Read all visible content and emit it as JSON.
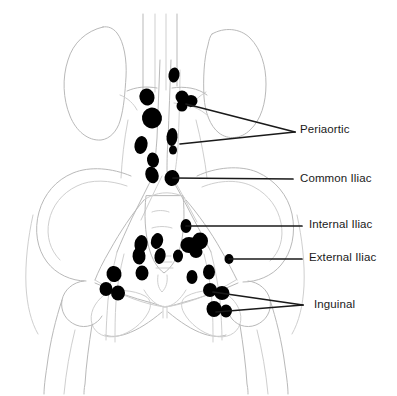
{
  "figure": {
    "name": "pelvic-lymph-node-regions-diagram",
    "background_color": "#ffffff",
    "node_color": "#000000",
    "outline_color": "#b9b9b9",
    "leader_color": "#1a1a1a",
    "text_color": "#1a1a1a"
  },
  "labels": [
    {
      "id": "periaortic",
      "text": "Periaortic",
      "x": 300,
      "y": 124,
      "leaders": [
        {
          "points": "295,132 186,104"
        },
        {
          "points": "295,132 180,144"
        }
      ]
    },
    {
      "id": "common-iliac",
      "text": "Common Iliac",
      "x": 300,
      "y": 173,
      "leaders": [
        {
          "points": "293,179 173,178"
        }
      ]
    },
    {
      "id": "internal-iliac",
      "text": "Internal Iliac",
      "x": 309,
      "y": 219,
      "leaders": [
        {
          "points": "302,226 186,226"
        }
      ]
    },
    {
      "id": "external-iliac",
      "text": "External Iliac",
      "x": 309,
      "y": 252,
      "leaders": [
        {
          "points": "302,259 229,259"
        }
      ]
    },
    {
      "id": "inguinal",
      "text": "Inguinal",
      "x": 314,
      "y": 299,
      "leaders": [
        {
          "points": "303,305 213,292"
        },
        {
          "points": "303,305 216,312"
        }
      ]
    }
  ],
  "lymph_nodes": [
    {
      "region": "periaortic",
      "cx": 174,
      "cy": 75,
      "rx": 5.5,
      "ry": 7.5,
      "rot": 10
    },
    {
      "region": "periaortic",
      "cx": 147,
      "cy": 97,
      "rx": 7.5,
      "ry": 8.5,
      "rot": -15
    },
    {
      "region": "periaortic",
      "cx": 182,
      "cy": 97,
      "rx": 6.5,
      "ry": 6.5,
      "rot": 0
    },
    {
      "region": "periaortic",
      "cx": 191,
      "cy": 101,
      "rx": 6.5,
      "ry": 6.0,
      "rot": 0
    },
    {
      "region": "periaortic",
      "cx": 182,
      "cy": 106,
      "rx": 5.5,
      "ry": 5.5,
      "rot": 0
    },
    {
      "region": "periaortic",
      "cx": 152,
      "cy": 118,
      "rx": 10.0,
      "ry": 10.5,
      "rot": -10
    },
    {
      "region": "periaortic",
      "cx": 141,
      "cy": 145,
      "rx": 6.5,
      "ry": 9.0,
      "rot": 12
    },
    {
      "region": "periaortic",
      "cx": 172,
      "cy": 137,
      "rx": 5.5,
      "ry": 9.0,
      "rot": 5
    },
    {
      "region": "periaortic",
      "cx": 173,
      "cy": 150,
      "rx": 4.0,
      "ry": 4.5,
      "rot": 0
    },
    {
      "region": "periaortic",
      "cx": 153,
      "cy": 160,
      "rx": 6.0,
      "ry": 7.5,
      "rot": -8
    },
    {
      "region": "common-iliac",
      "cx": 152,
      "cy": 175,
      "rx": 6.5,
      "ry": 8.5,
      "rot": -20
    },
    {
      "region": "common-iliac",
      "cx": 172,
      "cy": 178,
      "rx": 7.5,
      "ry": 8.0,
      "rot": 8
    },
    {
      "region": "internal-iliac",
      "cx": 186,
      "cy": 226,
      "rx": 5.5,
      "ry": 7.0,
      "rot": 0
    },
    {
      "region": "internal-iliac",
      "cx": 189,
      "cy": 245,
      "rx": 8.5,
      "ry": 8.0,
      "rot": 0
    },
    {
      "region": "internal-iliac",
      "cx": 200,
      "cy": 241,
      "rx": 8.0,
      "ry": 8.5,
      "rot": 0
    },
    {
      "region": "internal-iliac",
      "cx": 196,
      "cy": 252,
      "rx": 6.5,
      "ry": 6.0,
      "rot": 0
    },
    {
      "region": "internal-iliac",
      "cx": 178,
      "cy": 256,
      "rx": 5.0,
      "ry": 6.5,
      "rot": 0
    },
    {
      "region": "internal-iliac",
      "cx": 141,
      "cy": 244,
      "rx": 6.5,
      "ry": 9.0,
      "rot": 10
    },
    {
      "region": "internal-iliac",
      "cx": 139,
      "cy": 256,
      "rx": 6.5,
      "ry": 8.5,
      "rot": -5
    },
    {
      "region": "internal-iliac",
      "cx": 157,
      "cy": 241,
      "rx": 6.0,
      "ry": 8.0,
      "rot": 15
    },
    {
      "region": "internal-iliac",
      "cx": 160,
      "cy": 256,
      "rx": 5.5,
      "ry": 8.0,
      "rot": 10
    },
    {
      "region": "external-iliac",
      "cx": 229,
      "cy": 259,
      "rx": 4.5,
      "ry": 5.0,
      "rot": 0
    },
    {
      "region": "external-iliac",
      "cx": 209,
      "cy": 272,
      "rx": 6.0,
      "ry": 7.5,
      "rot": 0
    },
    {
      "region": "external-iliac",
      "cx": 192,
      "cy": 277,
      "rx": 5.5,
      "ry": 7.0,
      "rot": 0
    },
    {
      "region": "external-iliac",
      "cx": 142,
      "cy": 273,
      "rx": 6.5,
      "ry": 7.5,
      "rot": 0
    },
    {
      "region": "external-iliac",
      "cx": 114,
      "cy": 274,
      "rx": 7.5,
      "ry": 8.0,
      "rot": -10
    },
    {
      "region": "inguinal",
      "cx": 106,
      "cy": 289,
      "rx": 6.5,
      "ry": 7.0,
      "rot": 0
    },
    {
      "region": "inguinal",
      "cx": 118,
      "cy": 293,
      "rx": 7.0,
      "ry": 7.5,
      "rot": 0
    },
    {
      "region": "inguinal",
      "cx": 210,
      "cy": 290,
      "rx": 7.0,
      "ry": 7.0,
      "rot": 0
    },
    {
      "region": "inguinal",
      "cx": 222,
      "cy": 293,
      "rx": 7.5,
      "ry": 7.0,
      "rot": 0
    },
    {
      "region": "inguinal",
      "cx": 214,
      "cy": 309,
      "rx": 7.5,
      "ry": 8.0,
      "rot": 0
    },
    {
      "region": "inguinal",
      "cx": 226,
      "cy": 311,
      "rx": 6.0,
      "ry": 6.5,
      "rot": 0
    }
  ]
}
